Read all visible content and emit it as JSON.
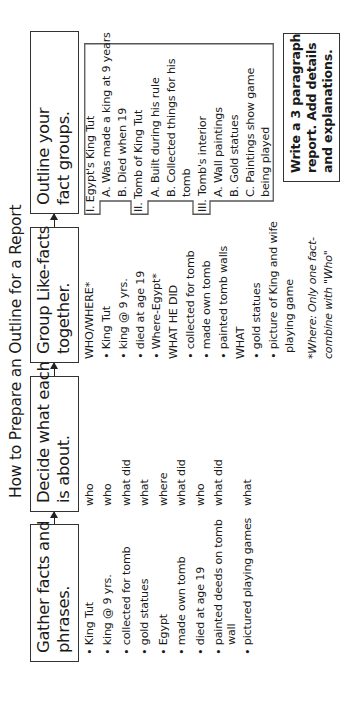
{
  "title": "How to Prepare an Outline for a Report",
  "steps": [
    {
      "label": "Gather facts and\nphrases."
    },
    {
      "label": "Decide what each\nis about."
    },
    {
      "label": "Group Like-facts\ntogether."
    },
    {
      "label": "Outline your\nfact groups."
    }
  ],
  "gather": {
    "items": [
      "• King Tut",
      "• king @ 9 yrs.",
      "• collected for tomb",
      "• gold statues",
      "• Egypt",
      "• made own tomb",
      "• died at age 19",
      "• painted deeds on tomb",
      "  wall",
      "• pictured playing games"
    ]
  },
  "decide": {
    "items": [
      "who",
      "who",
      "what did",
      "what",
      "where",
      "what did",
      "who",
      "what did",
      "what"
    ]
  },
  "group": {
    "items": [
      "WHO/WHERE*",
      "• King Tut",
      "• king @ 9 yrs.",
      "• died at age 19",
      "• Where-Egypt*",
      "WHAT HE DID",
      "• collected for tomb",
      "• made own tomb",
      "• painted tomb walls",
      "WHAT",
      "• gold statues",
      "• picture of King and wife",
      "  playing game"
    ],
    "footnote": [
      "*Where: Only one fact-",
      "combine with \"Who\""
    ]
  },
  "outline": {
    "tabs": [
      "I.",
      "II.",
      "III."
    ],
    "items": [
      "I. Egypt's King Tut",
      "  A. Was made a king at 9 years",
      "  B. Died when 19",
      "II. Tomb of King Tut",
      "  A. Built during his rule",
      "  B. Collected things for his",
      "       tomb",
      "III. Tomb's interior",
      "  A. Wall paintings",
      "  B. Gold statues",
      "  C. Paintings show game",
      "       being played"
    ]
  },
  "final_step": {
    "lines": [
      "Write a 3 paragraph",
      "report. Add details",
      "and explanations."
    ]
  }
}
